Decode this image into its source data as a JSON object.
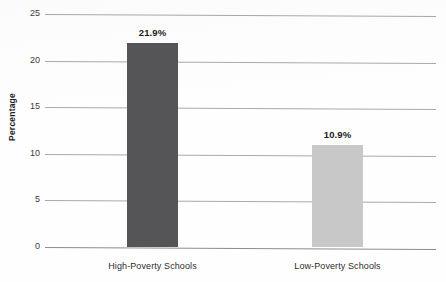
{
  "chart_data": {
    "type": "bar",
    "title": "",
    "title_clipped": true,
    "xlabel": "",
    "ylabel": "Percentage",
    "categories": [
      "High-Poverty Schools",
      "Low-Poverty Schools"
    ],
    "values": [
      21.9,
      10.9
    ],
    "value_labels": [
      "21.9%",
      "10.9%"
    ],
    "bar_colors": [
      "#555557",
      "#c8c8c8"
    ],
    "ylim": [
      0,
      25
    ],
    "yticks": [
      0,
      5,
      10,
      15,
      20,
      25
    ],
    "ytick_labels": [
      "0",
      "5",
      "10",
      "15",
      "20",
      "25"
    ],
    "grid": true,
    "grid_axis": "y",
    "legend": false,
    "background_color": "#fefefe",
    "gridline_color": "#a9a9ab"
  }
}
